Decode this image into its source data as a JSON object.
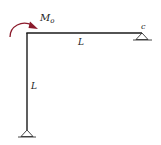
{
  "diagram": {
    "type": "structural-frame",
    "colors": {
      "member": "#1a1a1a",
      "moment_arrow": "#8b1a2b",
      "support": "#333333",
      "text": "#222222"
    },
    "labels": {
      "moment": "M",
      "moment_subscript": "o",
      "right_support": "c",
      "beam_length": "L",
      "column_length": "L"
    }
  }
}
